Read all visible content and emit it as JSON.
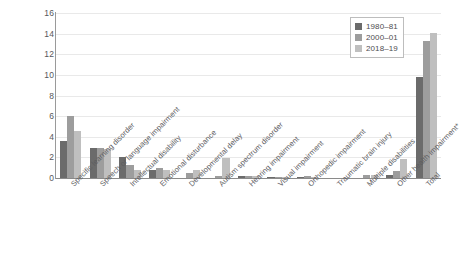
{
  "chart_data": {
    "type": "bar",
    "title": "",
    "subtitle": "",
    "xlabel": "",
    "ylabel": "",
    "ylim": [
      0,
      16
    ],
    "ytick_step": 2,
    "ytick_labels": [
      "0",
      "2",
      "4",
      "6",
      "8",
      "10",
      "12",
      "14",
      "16"
    ],
    "grid": true,
    "legend_position": "top-right",
    "categories": [
      "Specific learning disorder",
      "Speech or language impairment",
      "Intellectual disability",
      "Emotional disturbance",
      "Developmental delay",
      "Autism spectrum disorder",
      "Hearing impairment",
      "Visual impairment",
      "Orthopedic impairment",
      "Traumatic brain injury",
      "Multiple disabilities",
      "Other health impairment*",
      "Total"
    ],
    "series": [
      {
        "name": "1980–81",
        "color": "#6b6b6b",
        "values": [
          3.6,
          2.9,
          2.0,
          0.8,
          0.0,
          0.0,
          0.2,
          0.1,
          0.1,
          0.0,
          0.0,
          0.3,
          9.8
        ]
      },
      {
        "name": "2000–01",
        "color": "#9d9d9d",
        "values": [
          6.0,
          2.9,
          1.3,
          1.0,
          0.5,
          0.2,
          0.2,
          0.1,
          0.2,
          0.0,
          0.3,
          0.7,
          13.3
        ]
      },
      {
        "name": "2018–19",
        "color": "#bfbfbf",
        "values": [
          4.6,
          2.8,
          0.8,
          0.8,
          0.8,
          1.9,
          0.2,
          0.1,
          0.1,
          0.0,
          0.3,
          1.8,
          14.1
        ]
      }
    ],
    "annotations": []
  },
  "legend": {
    "entries": [
      {
        "label": "1980–81",
        "color": "#6b6b6b"
      },
      {
        "label": "2000–01",
        "color": "#9d9d9d"
      },
      {
        "label": "2018–19",
        "color": "#bfbfbf"
      }
    ]
  },
  "axis": {
    "y_max_label": "16",
    "y_min_label": "0"
  }
}
